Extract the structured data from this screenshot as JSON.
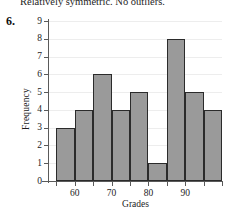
{
  "caption": {
    "text": "Relatively symmetric. No outliers."
  },
  "problem": {
    "number": "6."
  },
  "chart_data": {
    "type": "bar",
    "title": "",
    "subtitle": "",
    "xlabel": "Grades",
    "ylabel": "Frequency",
    "categories": [
      "55-60",
      "60-65",
      "65-70",
      "70-75",
      "75-80",
      "80-85",
      "85-90",
      "90-95",
      "95-100"
    ],
    "bin_edges": [
      55,
      60,
      65,
      70,
      75,
      80,
      85,
      90,
      95,
      100
    ],
    "values": [
      3,
      4,
      6,
      4,
      5,
      1,
      8,
      5,
      4
    ],
    "xlim": [
      53,
      100
    ],
    "ylim": [
      0,
      9
    ],
    "x_tick_labels": [
      "60",
      "70",
      "80",
      "90"
    ],
    "x_tick_values": [
      60,
      70,
      80,
      90
    ],
    "y_tick_labels": [
      "0",
      "1",
      "2",
      "3",
      "4",
      "5",
      "6",
      "7",
      "8",
      "9"
    ],
    "y_tick_values": [
      0,
      1,
      2,
      3,
      4,
      5,
      6,
      7,
      8,
      9
    ],
    "grid": true,
    "legend": "none",
    "colors": {
      "bar_fill": "#9a9a9a",
      "bar_edge": "#2b2b2b",
      "gridline": "#ededed",
      "axis": "#5a5a5a",
      "text": "#1c1c1c"
    }
  }
}
